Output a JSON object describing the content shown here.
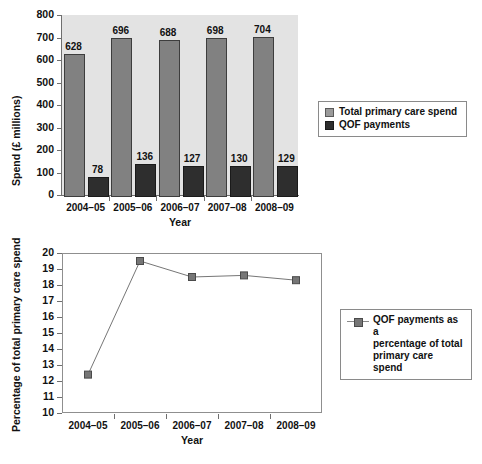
{
  "chart_data": [
    {
      "type": "bar",
      "title": "",
      "xlabel": "Year",
      "ylabel": "Spend (£ millions)",
      "ylim": [
        0,
        800
      ],
      "ytick_step": 100,
      "yticks": [
        "0",
        "100",
        "200",
        "300",
        "400",
        "500",
        "600",
        "700",
        "800"
      ],
      "grid": false,
      "legend_position": "right",
      "categories": [
        "2004–05",
        "2005–06",
        "2006–07",
        "2007–08",
        "2008–09"
      ],
      "series": [
        {
          "name": "Total primary care spend",
          "color": "#818181",
          "values": [
            628,
            696,
            688,
            698,
            704
          ],
          "labels": [
            "628",
            "696",
            "688",
            "698",
            "704"
          ]
        },
        {
          "name": "QOF payments",
          "color": "#2e2e2e",
          "values": [
            78,
            136,
            127,
            130,
            129
          ],
          "labels": [
            "78",
            "136",
            "127",
            "130",
            "129"
          ]
        }
      ]
    },
    {
      "type": "line",
      "title": "",
      "xlabel": "Year",
      "ylabel": "Percentage of total primary care spend",
      "ylim": [
        10,
        20
      ],
      "ytick_step": 1,
      "yticks": [
        "10",
        "11",
        "12",
        "13",
        "14",
        "15",
        "16",
        "17",
        "18",
        "19",
        "20"
      ],
      "grid": false,
      "legend_position": "right",
      "categories": [
        "2004–05",
        "2005–06",
        "2006–07",
        "2007–08",
        "2008–09"
      ],
      "series": [
        {
          "name": "QOF payments as a\npercentage of total\nprimary care spend",
          "color": "#767676",
          "marker": "square",
          "values": [
            12.4,
            19.5,
            18.5,
            18.6,
            18.3
          ]
        }
      ]
    }
  ],
  "bar_chart": {
    "ylabel": "Spend (£ millions)",
    "xlabel": "Year",
    "legend": {
      "items": [
        {
          "label": "Total primary care spend",
          "swatch": "total-spend-swatch"
        },
        {
          "label": "QOF payments",
          "swatch": "qof-payments-swatch"
        }
      ]
    }
  },
  "line_chart": {
    "ylabel": "Percentage of total primary care spend",
    "xlabel": "Year",
    "legend": {
      "items": [
        {
          "label": "QOF payments as a\npercentage of total\nprimary care spend",
          "marker": "line-square-marker"
        }
      ]
    }
  },
  "colors": {
    "total_spend_bar": "#818181",
    "qof_bar": "#2e2e2e",
    "plot_background": "#e3e3e3",
    "axis": "#6f6f6f",
    "line_series": "#767676"
  }
}
